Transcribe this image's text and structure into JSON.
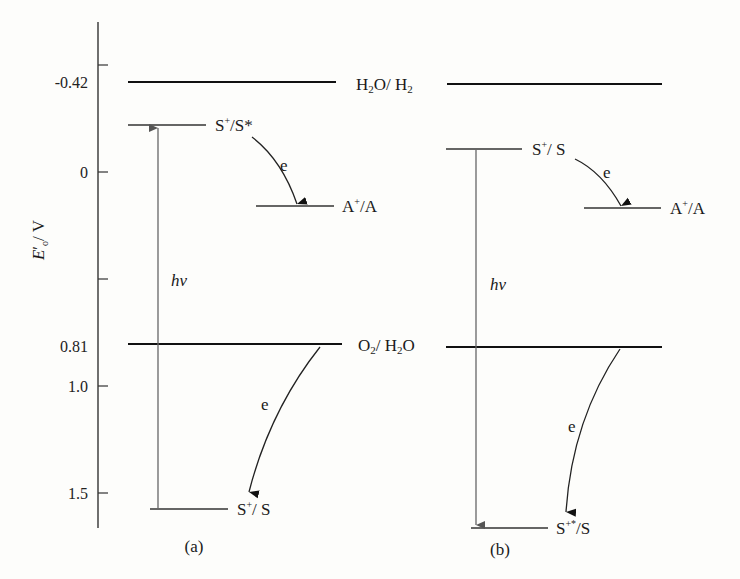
{
  "axis": {
    "label": "E′o / V",
    "label_main": "E",
    "label_sub": "o",
    "label_prime": "′",
    "label_unit": "/ V",
    "ticks": [
      {
        "value": -0.5,
        "label": ""
      },
      {
        "value": 0,
        "label": "0"
      },
      {
        "value": 0.5,
        "label": ""
      },
      {
        "value": 1.0,
        "label": "1.0"
      },
      {
        "value": 1.5,
        "label": "1.5"
      }
    ],
    "marked_levels": [
      {
        "value": -0.42,
        "label": "-0.42"
      },
      {
        "value": 0.81,
        "label": "0.81"
      }
    ]
  },
  "shared_levels": {
    "h2o_h2": {
      "potential": -0.42,
      "label_main": "H",
      "label_rest": "O/ H",
      "label": "H2O/H2"
    },
    "o2_h2o": {
      "potential": 0.81,
      "label": "O2/H2O"
    }
  },
  "panels": [
    {
      "id": "a",
      "caption": "(a)",
      "levels": [
        {
          "name": "S+/S*",
          "label": "S⁺/S*",
          "potential": -0.22
        },
        {
          "name": "A+/A",
          "label": "A⁺/A",
          "potential": 0.16
        },
        {
          "name": "S+/S",
          "label": "S⁺/S",
          "potential": 1.57
        }
      ],
      "excitation_label": "hν",
      "excitation_direction": "up",
      "electron_label_1": "e",
      "electron_label_2": "e"
    },
    {
      "id": "b",
      "caption": "(b)",
      "levels": [
        {
          "name": "S+/S",
          "label": "S⁺/S",
          "potential": -0.1
        },
        {
          "name": "A+/A",
          "label": "A⁺/A",
          "potential": 0.16
        },
        {
          "name": "S+*/S",
          "label": "S⁺*/S",
          "potential": 1.65
        }
      ],
      "excitation_label": "hν",
      "excitation_direction": "down",
      "electron_label_1": "e",
      "electron_label_2": "e"
    }
  ]
}
